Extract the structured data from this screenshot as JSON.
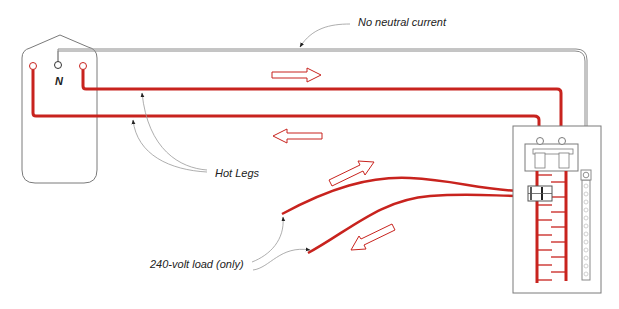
{
  "diagram": {
    "labels": {
      "neutral_terminal": "N",
      "no_neutral_current": "No neutral current",
      "hot_legs": "Hot Legs",
      "load": "240-volt load (only)"
    },
    "colors": {
      "hot_wire": "#c8231e",
      "neutral_wire": "#8a8a8a",
      "outline": "#7a7a7a",
      "text": "#222222",
      "background": "#ffffff"
    },
    "components": [
      {
        "id": "receptacle",
        "label": "Receptacle box"
      },
      {
        "id": "panel",
        "label": "Breaker panel"
      },
      {
        "id": "double-pole-breaker",
        "label": "Double-pole breaker"
      },
      {
        "id": "neutral-bar",
        "label": "Neutral bus bar"
      },
      {
        "id": "main-breaker",
        "label": "Main breaker"
      }
    ],
    "current_arrows": [
      {
        "id": "arrow-top-right",
        "direction": "right"
      },
      {
        "id": "arrow-mid-left",
        "direction": "left"
      },
      {
        "id": "arrow-load-up",
        "direction": "up-right"
      },
      {
        "id": "arrow-load-down",
        "direction": "down-left"
      }
    ]
  }
}
